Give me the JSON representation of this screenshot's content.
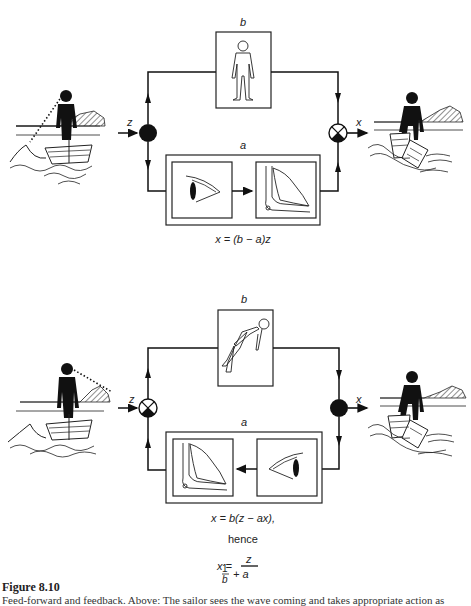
{
  "figure": {
    "title": "Figure 8.10",
    "caption": "Feed-forward and feedback. Above: The sailor sees the wave coming and takes appropriate action as"
  },
  "top_diagram": {
    "label_b": "b",
    "label_a": "a",
    "input_label": "z",
    "output_label": "x",
    "equation": "x = (b − a)z",
    "box_b_icon": "standing-human-outline",
    "box_a_icons": [
      "eye",
      "leg-bones-muscle"
    ],
    "left_junction": "filled-branch-point",
    "right_junction": "summing-junction"
  },
  "bottom_diagram": {
    "label_b": "b",
    "label_a": "a",
    "input_label": "z",
    "output_label": "x",
    "equation_1": "x = b(z − ax),",
    "equation_2": "hence",
    "equation_3_lhs": "x =",
    "equation_3_num": "z",
    "equation_3_den_num": "1",
    "equation_3_den_den": "b",
    "equation_3_den_tail": "+ a",
    "box_b_icon": "falling-human-outline",
    "box_a_icons": [
      "leg-bones-muscle",
      "eye"
    ],
    "left_junction": "summing-junction",
    "right_junction": "filled-branch-point"
  },
  "colors": {
    "ink": "#111111",
    "background": "#ffffff"
  }
}
